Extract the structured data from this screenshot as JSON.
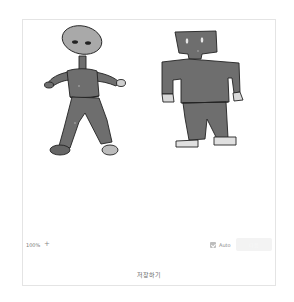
{
  "canvas": {
    "figures": [
      {
        "name": "round-head-figure",
        "head_color": "#a9a9a9",
        "body_color": "#6e6e6e",
        "shoe_left": "#666666",
        "shoe_right": "#bcbcbc"
      },
      {
        "name": "square-head-figure",
        "head_color": "#6e6e6e",
        "body_color": "#6e6e6e",
        "shoe_color": "#e0e0e0"
      }
    ]
  },
  "controls": {
    "zoom_level": "100%",
    "zoom_in_label": "+",
    "auto_label": "Auto",
    "auto_checked": true,
    "action_button_label": "다음"
  },
  "footer": {
    "save_label": "저장하기"
  }
}
